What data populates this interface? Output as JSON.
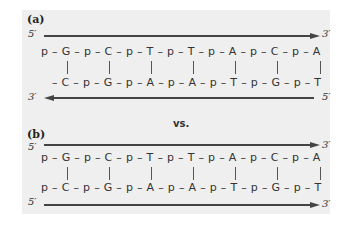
{
  "panel_a": {
    "label": "(a)",
    "top_strand": {
      "start": "5′",
      "end": "3′",
      "direction": "right",
      "sequence": "p – G – p – C – p – T – p – T – p – A – p – C – p – A"
    },
    "bottom_strand": {
      "start": "3′",
      "end": "5′",
      "direction": "left",
      "sequence": "– C – p – G – p – A – p – A – p – T – p – G – p – T"
    }
  },
  "vs_label": "vs.",
  "panel_b": {
    "label": "(b)",
    "top_strand": {
      "start": "5′",
      "end": "3′",
      "direction": "right",
      "sequence": "p – G – p – C – p – T – p – T – p – A – p – C – p – A"
    },
    "bottom_strand": {
      "start": "5′",
      "end": "3′",
      "direction": "right",
      "sequence": "p – C – p – G – p – A – p – A – p – T – p – G – p – T"
    }
  },
  "base_pairs": [
    "G-C",
    "C-G",
    "T-A",
    "T-A",
    "A-T",
    "C-G",
    "A-T"
  ]
}
